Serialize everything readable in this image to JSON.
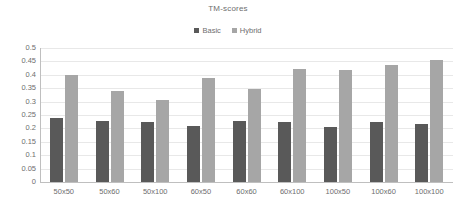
{
  "chart_data": {
    "type": "bar",
    "title": "TM-scores",
    "xlabel": "",
    "ylabel": "",
    "ylim": [
      0,
      0.5
    ],
    "grid": true,
    "legend_position": "top-center",
    "categories": [
      "50x50",
      "50x60",
      "50x100",
      "60x50",
      "60x60",
      "60x100",
      "100x50",
      "100x60",
      "100x100"
    ],
    "ytick_labels": [
      "0",
      "0.05",
      "0.1",
      "0.15",
      "0.2",
      "0.25",
      "0.3",
      "0.35",
      "0.4",
      "0.45",
      "0.5"
    ],
    "ytick_values": [
      0,
      0.05,
      0.1,
      0.15,
      0.2,
      0.25,
      0.3,
      0.35,
      0.4,
      0.45,
      0.5
    ],
    "series": [
      {
        "name": "Basic",
        "color": "#595959",
        "values": [
          0.24,
          0.228,
          0.225,
          0.208,
          0.227,
          0.223,
          0.206,
          0.225,
          0.216
        ]
      },
      {
        "name": "Hybrid",
        "color": "#a6a6a6",
        "values": [
          0.4,
          0.34,
          0.307,
          0.388,
          0.347,
          0.422,
          0.418,
          0.436,
          0.455
        ]
      }
    ]
  }
}
